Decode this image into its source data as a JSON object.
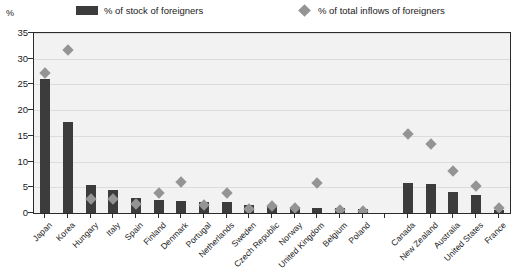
{
  "axis": {
    "unit_label": "%",
    "y_ticks": [
      0,
      5,
      10,
      15,
      20,
      25,
      30,
      35
    ],
    "y_min": 0,
    "y_max": 35
  },
  "legend": {
    "bar_label": "% of stock of foreigners",
    "diamond_label": "% of total inflows of foreigners",
    "bar_icon": "filled-square-icon",
    "diamond_icon": "filled-diamond-icon"
  },
  "colors": {
    "bar": "#3c3c3c",
    "diamond": "#949494",
    "plot_background": "#f2f2f2",
    "gridline": "#dcdcdc",
    "frame": "#2b2b2b"
  },
  "chart_data": {
    "type": "bar",
    "title": "",
    "subtitle": "",
    "xlabel": "",
    "ylabel": "%",
    "ylim": [
      0,
      35
    ],
    "ytick_step": 5,
    "grid": true,
    "legend_position": "top",
    "categories": [
      "Japan",
      "Korea",
      "Hungary",
      "Italy",
      "Spain",
      "Finland",
      "Denmark",
      "Portugal",
      "Netherlands",
      "Sweden",
      "Czech Republic",
      "Norway",
      "United Kingdom",
      "Belgium",
      "Poland",
      "",
      "Canada",
      "New Zealand",
      "Australia",
      "United States",
      "France"
    ],
    "series": [
      {
        "name": "% of stock of foreigners",
        "type": "bar",
        "values": [
          26.0,
          17.7,
          5.5,
          4.5,
          3.0,
          2.6,
          2.4,
          2.2,
          2.1,
          1.5,
          1.2,
          1.1,
          1.0,
          0.9,
          0.8,
          null,
          5.9,
          5.6,
          4.0,
          3.6,
          0.5
        ]
      },
      {
        "name": "% of total inflows of foreigners",
        "type": "scatter",
        "values": [
          28.0,
          32.5,
          3.6,
          3.5,
          2.5,
          4.6,
          6.8,
          2.4,
          4.7,
          1.5,
          2.1,
          1.7,
          6.6,
          1.3,
          1.1,
          null,
          16.1,
          14.2,
          9.0,
          6.0,
          1.7
        ]
      }
    ]
  }
}
